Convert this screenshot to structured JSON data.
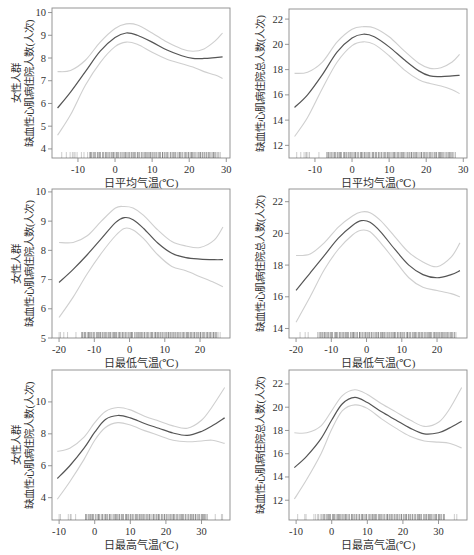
{
  "figure": {
    "colors": {
      "frame": "#8a8a8a",
      "curve": "#555555",
      "ci": "#cfcfcf",
      "rug": "#444444",
      "text": "#333333"
    }
  },
  "chart_data": [
    {
      "id": "female-mean-temp",
      "type": "line",
      "title": "",
      "xlabel": "日平均气温(℃)",
      "ylabel_lines": [
        "女性人群",
        "缺血性心肌病住院人数(人次)"
      ],
      "xlim": [
        -17,
        31
      ],
      "ylim": [
        3.6,
        10.2
      ],
      "xticks": [
        -10,
        0,
        10,
        20,
        30
      ],
      "yticks": [
        4,
        5,
        6,
        7,
        8,
        9,
        10
      ],
      "grid": false,
      "x": [
        -15.5,
        -12,
        -8,
        -4,
        0,
        3,
        6,
        10,
        14,
        18,
        21,
        24,
        27,
        29
      ],
      "series": [
        {
          "name": "estimate",
          "values": [
            5.8,
            6.5,
            7.4,
            8.3,
            8.9,
            9.1,
            9.0,
            8.7,
            8.35,
            8.1,
            7.98,
            7.98,
            8.02,
            8.05
          ]
        },
        {
          "name": "upper_ci",
          "values": [
            7.4,
            7.45,
            7.9,
            8.7,
            9.3,
            9.5,
            9.45,
            9.1,
            8.7,
            8.4,
            8.3,
            8.4,
            8.75,
            9.1
          ]
        },
        {
          "name": "lower_ci",
          "values": [
            4.6,
            5.5,
            6.8,
            7.8,
            8.5,
            8.7,
            8.6,
            8.25,
            7.95,
            7.75,
            7.6,
            7.4,
            7.25,
            7.1
          ]
        }
      ],
      "rug": {
        "from": -15,
        "to": 29,
        "dense_from": -7,
        "dense_to": 28
      }
    },
    {
      "id": "total-mean-temp",
      "type": "line",
      "title": "",
      "xlabel": "日平均气温(℃)",
      "ylabel_lines": [
        "缺血性心肌病住院总人数(人次)"
      ],
      "xlim": [
        -17,
        31
      ],
      "ylim": [
        11,
        22.8
      ],
      "xticks": [
        -10,
        0,
        10,
        20,
        30
      ],
      "yticks": [
        12,
        14,
        16,
        18,
        20,
        22
      ],
      "grid": false,
      "x": [
        -15.5,
        -12,
        -8,
        -4,
        0,
        3,
        6,
        10,
        14,
        18,
        21,
        24,
        27,
        29
      ],
      "series": [
        {
          "name": "estimate",
          "values": [
            15.0,
            16.0,
            17.6,
            19.4,
            20.5,
            20.8,
            20.6,
            19.8,
            18.8,
            17.9,
            17.5,
            17.45,
            17.5,
            17.55
          ]
        },
        {
          "name": "upper_ci",
          "values": [
            17.7,
            17.8,
            18.6,
            20.2,
            21.2,
            21.4,
            21.3,
            20.6,
            19.5,
            18.5,
            18.1,
            18.15,
            18.6,
            19.2
          ]
        },
        {
          "name": "lower_ci",
          "values": [
            12.7,
            14.2,
            16.5,
            18.6,
            19.9,
            20.2,
            20.0,
            19.1,
            18.0,
            17.2,
            16.9,
            16.7,
            16.4,
            16.1
          ]
        }
      ],
      "rug": {
        "from": -15,
        "to": 29,
        "dense_from": -7,
        "dense_to": 28
      }
    },
    {
      "id": "female-min-temp",
      "type": "line",
      "title": "",
      "xlabel": "日最低气温(℃)",
      "ylabel_lines": [
        "女性人群",
        "缺血性心肌病住院人数(人次)"
      ],
      "xlim": [
        -22,
        28.5
      ],
      "ylim": [
        5,
        10.1
      ],
      "xticks": [
        -20,
        -10,
        0,
        10,
        20
      ],
      "yticks": [
        5,
        6,
        7,
        8,
        9,
        10
      ],
      "grid": false,
      "x": [
        -20,
        -16,
        -12,
        -8,
        -4,
        -1.5,
        1,
        4,
        8,
        12,
        16,
        20,
        24,
        26.5
      ],
      "series": [
        {
          "name": "estimate",
          "values": [
            6.9,
            7.35,
            7.85,
            8.4,
            8.95,
            9.12,
            9.05,
            8.75,
            8.25,
            7.9,
            7.75,
            7.7,
            7.68,
            7.68
          ]
        },
        {
          "name": "upper_ci",
          "values": [
            8.27,
            8.27,
            8.5,
            9.0,
            9.45,
            9.5,
            9.45,
            9.2,
            8.7,
            8.3,
            8.15,
            8.1,
            8.35,
            8.8
          ]
        },
        {
          "name": "lower_ci",
          "values": [
            5.7,
            6.4,
            7.2,
            7.9,
            8.5,
            8.75,
            8.7,
            8.4,
            7.85,
            7.45,
            7.3,
            7.1,
            6.9,
            6.75
          ]
        }
      ],
      "rug": {
        "from": -20,
        "to": 26,
        "dense_from": -14,
        "dense_to": 25
      }
    },
    {
      "id": "total-min-temp",
      "type": "line",
      "title": "",
      "xlabel": "日最低气温(℃)",
      "ylabel_lines": [
        "缺血性心肌病住院总人数(人次)"
      ],
      "xlim": [
        -22,
        28.5
      ],
      "ylim": [
        13.4,
        22.8
      ],
      "xticks": [
        -20,
        -10,
        0,
        10,
        20
      ],
      "yticks": [
        14,
        16,
        18,
        20,
        22
      ],
      "grid": false,
      "x": [
        -20,
        -16,
        -12,
        -8,
        -4,
        -1.5,
        1,
        4,
        8,
        12,
        16,
        20,
        24,
        26.5
      ],
      "series": [
        {
          "name": "estimate",
          "values": [
            16.4,
            17.5,
            18.6,
            19.7,
            20.5,
            20.8,
            20.7,
            20.1,
            19.0,
            18.0,
            17.4,
            17.2,
            17.4,
            17.65
          ]
        },
        {
          "name": "upper_ci",
          "values": [
            18.6,
            18.7,
            19.4,
            20.4,
            21.1,
            21.35,
            21.3,
            20.8,
            19.8,
            18.8,
            18.2,
            17.9,
            18.5,
            19.4
          ]
        },
        {
          "name": "lower_ci",
          "values": [
            14.4,
            16.0,
            17.7,
            19.0,
            19.9,
            20.2,
            20.1,
            19.4,
            18.3,
            17.2,
            16.6,
            16.4,
            16.2,
            16.0
          ]
        }
      ],
      "rug": {
        "from": -20,
        "to": 26,
        "dense_from": -14,
        "dense_to": 25
      }
    },
    {
      "id": "female-max-temp",
      "type": "line",
      "title": "",
      "xlabel": "日最高气温(℃)",
      "ylabel_lines": [
        "女性人群",
        "缺血性心肌病住院人数(人次)"
      ],
      "xlim": [
        -12,
        38
      ],
      "ylim": [
        2.6,
        12
      ],
      "xticks": [
        -10,
        0,
        10,
        20,
        30
      ],
      "yticks": [
        4,
        6,
        8,
        10
      ],
      "grid": false,
      "x": [
        -10.5,
        -7,
        -3,
        0,
        3,
        6.5,
        10,
        14,
        18,
        22,
        26,
        30,
        33,
        36.5
      ],
      "series": [
        {
          "name": "estimate",
          "values": [
            5.2,
            6.0,
            7.1,
            8.1,
            8.9,
            9.15,
            9.0,
            8.65,
            8.35,
            8.05,
            7.9,
            8.15,
            8.5,
            9.0
          ]
        },
        {
          "name": "upper_ci",
          "values": [
            6.9,
            7.1,
            7.8,
            8.7,
            9.4,
            9.65,
            9.5,
            9.1,
            8.8,
            8.5,
            8.35,
            8.85,
            9.7,
            10.9
          ]
        },
        {
          "name": "lower_ci",
          "values": [
            3.9,
            5.0,
            6.4,
            7.6,
            8.4,
            8.7,
            8.55,
            8.2,
            7.9,
            7.6,
            7.5,
            7.55,
            7.6,
            7.4
          ]
        }
      ],
      "rug": {
        "from": -10,
        "to": 36,
        "dense_from": -3,
        "dense_to": 32
      }
    },
    {
      "id": "total-max-temp",
      "type": "line",
      "title": "",
      "xlabel": "日最高气温(℃)",
      "ylabel_lines": [
        "缺血性心肌病住院总人数(人次)"
      ],
      "xlim": [
        -12,
        38
      ],
      "ylim": [
        10.3,
        23.2
      ],
      "xticks": [
        -10,
        0,
        10,
        20,
        30
      ],
      "yticks": [
        12,
        14,
        16,
        18,
        20,
        22
      ],
      "grid": false,
      "x": [
        -10.5,
        -7,
        -3,
        0,
        3,
        6.5,
        10,
        14,
        18,
        22,
        26,
        30,
        33,
        36.5
      ],
      "series": [
        {
          "name": "estimate",
          "values": [
            14.8,
            15.8,
            17.3,
            18.9,
            20.3,
            20.85,
            20.4,
            19.6,
            18.9,
            18.2,
            17.7,
            17.8,
            18.2,
            18.8
          ]
        },
        {
          "name": "upper_ci",
          "values": [
            17.8,
            17.8,
            18.4,
            19.7,
            21.0,
            21.5,
            21.1,
            20.3,
            19.6,
            18.9,
            18.35,
            18.7,
            19.8,
            21.7
          ]
        },
        {
          "name": "lower_ci",
          "values": [
            12.1,
            13.8,
            16.0,
            18.1,
            19.7,
            20.2,
            19.9,
            19.0,
            18.2,
            17.5,
            17.1,
            17.0,
            16.9,
            16.5
          ]
        }
      ],
      "rug": {
        "from": -10,
        "to": 36,
        "dense_from": -3,
        "dense_to": 32
      }
    }
  ],
  "layout": {
    "panels": [
      {
        "left": 52,
        "top": 8,
        "width": 178,
        "height": 150
      },
      {
        "left": 289,
        "top": 9,
        "width": 178,
        "height": 149
      },
      {
        "left": 52,
        "top": 189,
        "width": 178,
        "height": 149
      },
      {
        "left": 289,
        "top": 189,
        "width": 178,
        "height": 149
      },
      {
        "left": 52,
        "top": 370,
        "width": 178,
        "height": 150
      },
      {
        "left": 289,
        "top": 370,
        "width": 178,
        "height": 150
      }
    ]
  }
}
